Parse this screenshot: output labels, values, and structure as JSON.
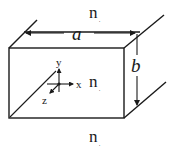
{
  "diagram": {
    "type": "rectangular waveguide / slab cross-section schematic",
    "colors": {
      "stroke": "#1a1a1a",
      "background": "#ffffff"
    },
    "dimensions": {
      "width_label": "a",
      "height_label": "b"
    },
    "regions": [
      {
        "id": "top",
        "label": "n",
        "subscript": ","
      },
      {
        "id": "core",
        "label": "n",
        "subscript": ","
      },
      {
        "id": "bottom",
        "label": "n",
        "subscript": ","
      }
    ],
    "axes": {
      "x": "x",
      "y": "y",
      "z": "z"
    }
  }
}
